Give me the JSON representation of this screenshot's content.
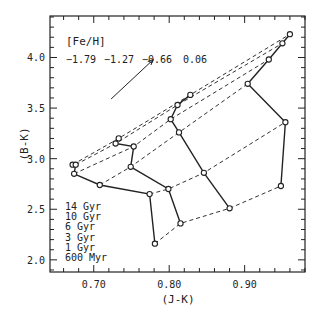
{
  "chart_data": {
    "type": "line",
    "title": "",
    "xlabel": "(J-K)",
    "ylabel": "(B-K)",
    "xlim": [
      0.642,
      0.98
    ],
    "ylim": [
      1.88,
      4.41
    ],
    "xticks": [
      0.7,
      0.8,
      0.9
    ],
    "xtick_labels": [
      "0.70",
      "0.80",
      "0.90"
    ],
    "yticks": [
      2.0,
      2.5,
      3.0,
      3.5,
      4.0
    ],
    "ytick_labels": [
      "2.0",
      "2.5",
      "3.0",
      "3.5",
      "4.0"
    ],
    "grid": false,
    "legend_title": "[Fe/H]",
    "metallicity_labels": [
      "-1.79",
      "-1.27",
      "-0.66",
      "0.06"
    ],
    "age_labels": [
      "14 Gyr",
      "10 Gyr",
      "6 Gyr",
      "3 Gyr",
      "1 Gyr",
      "600 Myr"
    ],
    "annotation_arrow": {
      "from": [
        0.723,
        3.59
      ],
      "to": [
        0.779,
        3.98
      ]
    },
    "series": [
      {
        "name": "[Fe/H] = -1.79",
        "style": "solid",
        "marker": "circle",
        "x": [
          0.672,
          0.676,
          0.674,
          0.708,
          0.774,
          0.781
        ],
        "y": [
          2.94,
          2.94,
          2.85,
          2.74,
          2.65,
          2.16
        ]
      },
      {
        "name": "[Fe/H] = -1.27",
        "style": "solid",
        "marker": "circle",
        "x": [
          0.733,
          0.729,
          0.753,
          0.749,
          0.799,
          0.815
        ],
        "y": [
          3.2,
          3.15,
          3.12,
          2.92,
          2.7,
          2.36
        ]
      },
      {
        "name": "[Fe/H] = -0.66",
        "style": "solid",
        "marker": "circle",
        "x": [
          0.828,
          0.811,
          0.802,
          0.813,
          0.846,
          0.88
        ],
        "y": [
          3.63,
          3.53,
          3.39,
          3.26,
          2.86,
          2.51
        ]
      },
      {
        "name": "[Fe/H] = 0.06",
        "style": "solid",
        "marker": "circle",
        "x": [
          0.96,
          0.95,
          0.932,
          0.904,
          0.954,
          0.948
        ],
        "y": [
          4.23,
          4.14,
          3.98,
          3.74,
          3.36,
          2.73
        ]
      }
    ],
    "isochrones": [
      {
        "name": "14 Gyr",
        "style": "dashed",
        "x": [
          0.672,
          0.733,
          0.828,
          0.96
        ],
        "y": [
          2.94,
          3.2,
          3.63,
          4.23
        ]
      },
      {
        "name": "10 Gyr",
        "style": "dashed",
        "x": [
          0.676,
          0.729,
          0.811,
          0.95
        ],
        "y": [
          2.94,
          3.15,
          3.53,
          4.14
        ]
      },
      {
        "name": "6 Gyr",
        "style": "dashed",
        "x": [
          0.674,
          0.753,
          0.802,
          0.932
        ],
        "y": [
          2.85,
          3.12,
          3.39,
          3.98
        ]
      },
      {
        "name": "3 Gyr",
        "style": "dashed",
        "x": [
          0.708,
          0.749,
          0.813,
          0.904
        ],
        "y": [
          2.74,
          2.92,
          3.26,
          3.74
        ]
      },
      {
        "name": "1 Gyr",
        "style": "dashed",
        "x": [
          0.774,
          0.799,
          0.846,
          0.954
        ],
        "y": [
          2.65,
          2.7,
          2.86,
          3.36
        ]
      },
      {
        "name": "600 Myr",
        "style": "dashed",
        "x": [
          0.781,
          0.815,
          0.88,
          0.948
        ],
        "y": [
          2.16,
          2.36,
          2.51,
          2.73
        ]
      }
    ]
  }
}
